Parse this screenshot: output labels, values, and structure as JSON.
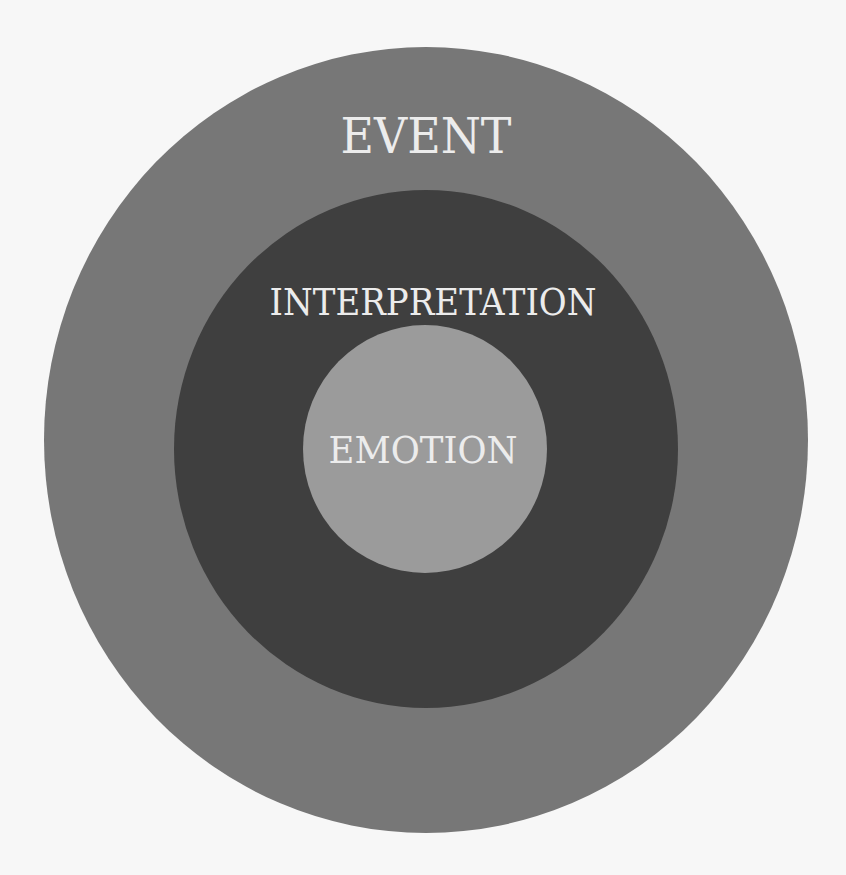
{
  "diagram": {
    "type": "concentric-circles",
    "background_color": "#f7f7f7",
    "text_color": "#ececec",
    "layers": [
      {
        "id": "outer",
        "label": "EVENT",
        "fill": "#777777",
        "cx": 426,
        "cy": 440,
        "rx": 382,
        "ry": 393,
        "label_x": 426,
        "label_baseline_y": 153,
        "font_size": 48,
        "label_width": 171
      },
      {
        "id": "middle",
        "label": "INTERPRETATION",
        "fill": "#3f3f3f",
        "cx": 426,
        "cy": 449,
        "rx": 252,
        "ry": 259,
        "label_x": 433,
        "label_baseline_y": 315,
        "font_size": 37,
        "label_width": 327
      },
      {
        "id": "inner",
        "label": "EMOTION",
        "fill": "#9b9b9b",
        "cx": 425,
        "cy": 449,
        "rx": 122,
        "ry": 124,
        "label_x": 423,
        "label_baseline_y": 463,
        "font_size": 37,
        "label_width": 189
      }
    ]
  }
}
